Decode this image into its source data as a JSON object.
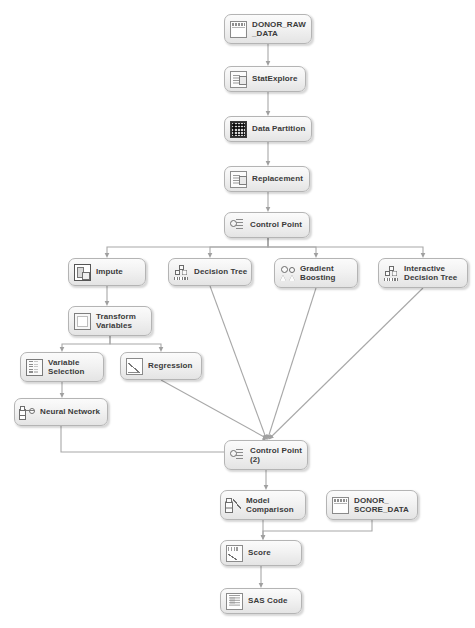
{
  "diagram": {
    "background_color": "#ffffff",
    "node_fill_color": "#f0f0f0",
    "node_border_color": "#b4b4b4",
    "node_text_color": "#3a3a3a",
    "edge_color": "#a8a8a8"
  },
  "nodes": [
    {
      "id": "donor_raw_data",
      "label": "DONOR_RAW\n_DATA",
      "icon": "table-icon",
      "x": 224,
      "y": 14,
      "w": 88,
      "h": 30
    },
    {
      "id": "stat_explore",
      "label": "StatExplore",
      "icon": "doc-icon",
      "x": 224,
      "y": 66,
      "w": 82,
      "h": 26
    },
    {
      "id": "data_partition",
      "label": "Data Partition",
      "icon": "grid-icon",
      "x": 224,
      "y": 116,
      "w": 88,
      "h": 26
    },
    {
      "id": "replacement",
      "label": "Replacement",
      "icon": "doc-icon",
      "x": 224,
      "y": 166,
      "w": 86,
      "h": 26
    },
    {
      "id": "control_point",
      "label": "Control Point",
      "icon": "control-point-icon",
      "x": 224,
      "y": 212,
      "w": 86,
      "h": 26
    },
    {
      "id": "impute",
      "label": "Impute",
      "icon": "impute-icon",
      "x": 68,
      "y": 258,
      "w": 78,
      "h": 28
    },
    {
      "id": "decision_tree",
      "label": "Decision Tree",
      "icon": "tree-icon",
      "x": 168,
      "y": 258,
      "w": 84,
      "h": 28
    },
    {
      "id": "gradient_boosting",
      "label": "Gradient\nBoosting",
      "icon": "gradient-boosting-icon",
      "x": 274,
      "y": 258,
      "w": 84,
      "h": 30
    },
    {
      "id": "interactive_tree",
      "label": "Interactive\nDecision Tree",
      "icon": "tree-icon",
      "x": 378,
      "y": 258,
      "w": 90,
      "h": 30
    },
    {
      "id": "transform_vars",
      "label": "Transform\nVariables",
      "icon": "formula-icon",
      "x": 68,
      "y": 306,
      "w": 84,
      "h": 30
    },
    {
      "id": "variable_selection",
      "label": "Variable\nSelection",
      "icon": "variable-selection-icon",
      "x": 20,
      "y": 352,
      "w": 84,
      "h": 30
    },
    {
      "id": "regression",
      "label": "Regression",
      "icon": "regression-icon",
      "x": 120,
      "y": 352,
      "w": 82,
      "h": 28
    },
    {
      "id": "neural_network",
      "label": "Neural Network",
      "icon": "neural-network-icon",
      "x": 14,
      "y": 398,
      "w": 94,
      "h": 28
    },
    {
      "id": "control_point_2",
      "label": "Control Point\n(2)",
      "icon": "control-point-icon",
      "x": 224,
      "y": 440,
      "w": 84,
      "h": 30
    },
    {
      "id": "model_comparison",
      "label": "Model\nComparison",
      "icon": "model-comparison-icon",
      "x": 220,
      "y": 490,
      "w": 86,
      "h": 30
    },
    {
      "id": "donor_score_data",
      "label": "DONOR_\nSCORE_DATA",
      "icon": "table-icon",
      "x": 326,
      "y": 490,
      "w": 92,
      "h": 30
    },
    {
      "id": "score",
      "label": "Score",
      "icon": "score-icon",
      "x": 220,
      "y": 540,
      "w": 82,
      "h": 26
    },
    {
      "id": "sas_code",
      "label": "SAS Code",
      "icon": "sas-code-icon",
      "x": 220,
      "y": 588,
      "w": 82,
      "h": 26
    }
  ],
  "edges": [
    {
      "from": "donor_raw_data",
      "to": "stat_explore"
    },
    {
      "from": "stat_explore",
      "to": "data_partition"
    },
    {
      "from": "data_partition",
      "to": "replacement"
    },
    {
      "from": "replacement",
      "to": "control_point"
    },
    {
      "from": "control_point",
      "to": "impute"
    },
    {
      "from": "control_point",
      "to": "decision_tree"
    },
    {
      "from": "control_point",
      "to": "gradient_boosting"
    },
    {
      "from": "control_point",
      "to": "interactive_tree"
    },
    {
      "from": "impute",
      "to": "transform_vars"
    },
    {
      "from": "transform_vars",
      "to": "variable_selection"
    },
    {
      "from": "transform_vars",
      "to": "regression"
    },
    {
      "from": "variable_selection",
      "to": "neural_network"
    },
    {
      "from": "neural_network",
      "to": "control_point_2"
    },
    {
      "from": "regression",
      "to": "control_point_2"
    },
    {
      "from": "decision_tree",
      "to": "control_point_2"
    },
    {
      "from": "gradient_boosting",
      "to": "control_point_2"
    },
    {
      "from": "interactive_tree",
      "to": "control_point_2"
    },
    {
      "from": "control_point_2",
      "to": "model_comparison"
    },
    {
      "from": "model_comparison",
      "to": "score"
    },
    {
      "from": "donor_score_data",
      "to": "score"
    },
    {
      "from": "score",
      "to": "sas_code"
    }
  ]
}
